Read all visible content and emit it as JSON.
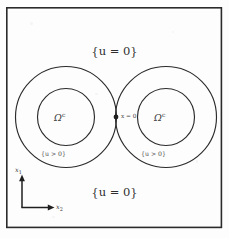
{
  "figure": {
    "type": "mathematical-diagram",
    "background_color": "#fdfdfd",
    "line_color": "#2b2b2b",
    "frame": {
      "x": 6,
      "y": 7,
      "width": 216,
      "height": 221,
      "stroke_width": 1.6
    },
    "labels": {
      "top_region": "{u = 0}",
      "bottom_region": "{u = 0}",
      "left_annulus": "{u > 0}",
      "right_annulus": "{u > 0}",
      "left_inner": "Ω",
      "left_inner_sup": "c",
      "right_inner": "Ω",
      "right_inner_sup": "c",
      "origin": "x = 0"
    },
    "axes": {
      "vertical_label": "x",
      "vertical_sub": "1",
      "horizontal_label": "x",
      "horizontal_sub": "2",
      "origin_point": [
        22,
        207
      ],
      "vertical_tip": [
        22,
        176
      ],
      "horizontal_tip": [
        54,
        207
      ]
    },
    "circles": [
      {
        "name": "left-outer-circle",
        "cx": 66,
        "cy": 117,
        "r": 50.5
      },
      {
        "name": "left-inner-circle",
        "cx": 66,
        "cy": 117,
        "r": 28.5
      },
      {
        "name": "right-outer-circle",
        "cx": 166,
        "cy": 117,
        "r": 50.5
      },
      {
        "name": "right-inner-circle",
        "cx": 166,
        "cy": 117,
        "r": 28.5
      }
    ],
    "tangency_point": {
      "name": "origin-dot",
      "cx": 116,
      "cy": 117,
      "r": 2.4
    }
  }
}
